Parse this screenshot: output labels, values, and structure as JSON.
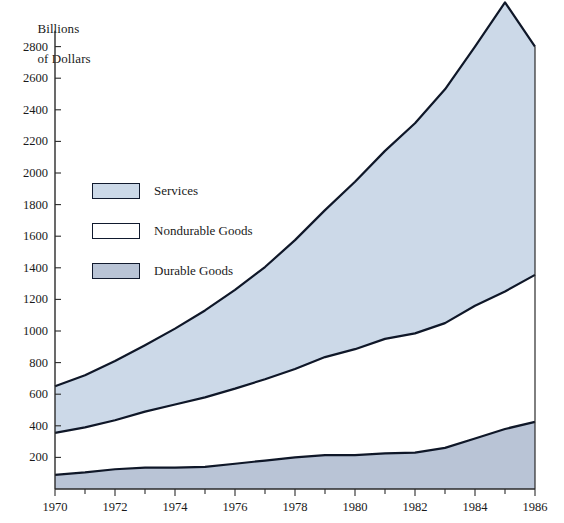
{
  "chart_data": {
    "type": "area",
    "stacked": true,
    "title": "",
    "xlabel": "",
    "ylabel": "Billions\nof Dollars",
    "xlim": [
      1970,
      1986
    ],
    "ylim": [
      0,
      2900
    ],
    "yticks": [
      200,
      400,
      600,
      800,
      1000,
      1200,
      1400,
      1600,
      1800,
      2000,
      2200,
      2400,
      2600,
      2800
    ],
    "xticks": [
      1970,
      1971,
      1972,
      1973,
      1974,
      1975,
      1976,
      1977,
      1978,
      1979,
      1980,
      1981,
      1982,
      1983,
      1984,
      1985,
      1986
    ],
    "xtick_labels": [
      "1970",
      "",
      "1972",
      "",
      "1974",
      "",
      "1976",
      "",
      "1978",
      "",
      "1980",
      "",
      "1982",
      "",
      "1984",
      "",
      "1986"
    ],
    "grid": false,
    "legend_position": "upper-left-inside",
    "x": [
      1970,
      1971,
      1972,
      1973,
      1974,
      1975,
      1976,
      1977,
      1978,
      1979,
      1980,
      1981,
      1982,
      1983,
      1984,
      1985,
      1986
    ],
    "series": [
      {
        "name": "Durable Goods",
        "color": "#b9c4d6",
        "values": [
          90,
          105,
          125,
          135,
          135,
          140,
          160,
          180,
          200,
          215,
          215,
          225,
          230,
          260,
          320,
          380,
          425
        ]
      },
      {
        "name": "Nondurable Goods",
        "color": "#ffffff",
        "values": [
          265,
          285,
          310,
          355,
          400,
          440,
          475,
          515,
          560,
          620,
          670,
          725,
          755,
          790,
          840,
          870,
          930
        ]
      },
      {
        "name": "Services",
        "color": "#ccd9e8",
        "values": [
          295,
          330,
          375,
          420,
          480,
          550,
          625,
          710,
          815,
          930,
          1060,
          1190,
          1330,
          1480,
          1640,
          1830,
          1445
        ]
      }
    ],
    "cumulative_tops": {
      "durable": [
        90,
        105,
        125,
        135,
        135,
        140,
        160,
        180,
        200,
        215,
        215,
        225,
        230,
        260,
        320,
        380,
        425
      ],
      "durable_plus_nondurable": [
        355,
        390,
        435,
        490,
        535,
        580,
        635,
        695,
        760,
        835,
        885,
        950,
        985,
        1050,
        1160,
        1250,
        1355
      ],
      "total": [
        650,
        720,
        810,
        910,
        1015,
        1130,
        1260,
        1405,
        1575,
        1765,
        1945,
        2140,
        2315,
        2530,
        2800,
        3080,
        2800
      ]
    }
  },
  "axis": {
    "y_label_line1": "Billions",
    "y_label_line2": "of Dollars"
  },
  "legend": {
    "items": [
      {
        "label": "Services",
        "color": "#ccd9e8"
      },
      {
        "label": "Nondurable Goods",
        "color": "#ffffff"
      },
      {
        "label": "Durable Goods",
        "color": "#b9c4d6"
      }
    ]
  },
  "colors": {
    "services_fill": "#ccd9e8",
    "nondurable_fill": "#ffffff",
    "durable_fill": "#b9c4d6",
    "line": "#0f1728",
    "axis": "#2b2b2b",
    "text": "#1a1a1a"
  }
}
